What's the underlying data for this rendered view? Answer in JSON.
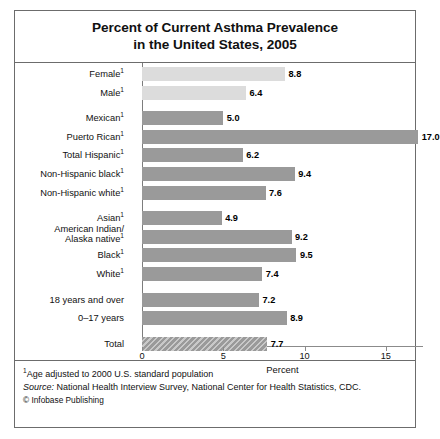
{
  "chart_data": {
    "type": "bar",
    "orientation": "horizontal",
    "title": "Percent of Current Asthma Prevalence in the United States, 2005",
    "title_line1": "Percent of Current Asthma Prevalence",
    "title_line2": "in the United States, 2005",
    "xlabel": "Percent",
    "ylabel": "",
    "xlim": [
      0,
      17.3
    ],
    "xticks": [
      0,
      5,
      10,
      15
    ],
    "xtick_labels": [
      "0",
      "5",
      "10",
      "15"
    ],
    "grid": false,
    "legend": false,
    "categories": [
      "Female¹",
      "Male¹",
      "Mexican¹",
      "Puerto Rican¹",
      "Total Hispanic¹",
      "Non-Hispanic black¹",
      "Non-Hispanic white¹",
      "Asian¹",
      "American Indian/ Alaska native¹",
      "Black¹",
      "White¹",
      "18 years and over",
      "0–17 years",
      "Total"
    ],
    "values": [
      8.8,
      6.4,
      5.0,
      17.0,
      6.2,
      9.4,
      7.6,
      4.9,
      9.2,
      9.5,
      7.4,
      7.2,
      8.9,
      7.7
    ],
    "value_labels": [
      "8.8",
      "6.4",
      "5.0",
      "17.0",
      "6.2",
      "9.4",
      "7.6",
      "4.9",
      "9.2",
      "9.5",
      "7.4",
      "7.2",
      "8.9",
      "7.7"
    ],
    "colors": {
      "bar_default": "#9a9a9a",
      "bar_light": "#dcdcdc",
      "bar_hatch": "#9a9a9a",
      "frame": "#6c6c6c",
      "axis": "#8b8b8b",
      "text": "#111111"
    }
  },
  "bars": [
    {
      "label_html": "Female<sup>1</sup>",
      "value_label": "8.8",
      "value": 8.8,
      "style": "light",
      "group": 0
    },
    {
      "label_html": "Male<sup>1</sup>",
      "value_label": "6.4",
      "value": 6.4,
      "style": "light",
      "group": 0
    },
    {
      "label_html": "Mexican<sup>1</sup>",
      "value_label": "5.0",
      "value": 5.0,
      "style": "solid",
      "group": 1
    },
    {
      "label_html": "Puerto Rican<sup>1</sup>",
      "value_label": "17.0",
      "value": 17.0,
      "style": "solid",
      "group": 1
    },
    {
      "label_html": "Total Hispanic<sup>1</sup>",
      "value_label": "6.2",
      "value": 6.2,
      "style": "solid",
      "group": 1
    },
    {
      "label_html": "Non-Hispanic black<sup>1</sup>",
      "value_label": "9.4",
      "value": 9.4,
      "style": "solid",
      "group": 1
    },
    {
      "label_html": "Non-Hispanic white<sup>1</sup>",
      "value_label": "7.6",
      "value": 7.6,
      "style": "solid",
      "group": 1
    },
    {
      "label_html": "Asian<sup>1</sup>",
      "value_label": "4.9",
      "value": 4.9,
      "style": "solid",
      "group": 2
    },
    {
      "label_html": "American Indian/<br>Alaska native<sup>1</sup>",
      "value_label": "9.2",
      "value": 9.2,
      "style": "solid",
      "group": 2,
      "two_line": true
    },
    {
      "label_html": "Black<sup>1</sup>",
      "value_label": "9.5",
      "value": 9.5,
      "style": "solid",
      "group": 2
    },
    {
      "label_html": "White<sup>1</sup>",
      "value_label": "7.4",
      "value": 7.4,
      "style": "solid",
      "group": 2
    },
    {
      "label_html": "18 years and over",
      "value_label": "7.2",
      "value": 7.2,
      "style": "solid",
      "group": 3
    },
    {
      "label_html": "0–17 years",
      "value_label": "8.9",
      "value": 8.9,
      "style": "solid",
      "group": 3
    },
    {
      "label_html": "Total",
      "value_label": "7.7",
      "value": 7.7,
      "style": "hatch",
      "group": 4
    }
  ],
  "axis": {
    "xlabel": "Percent",
    "ticks": [
      "0",
      "5",
      "10",
      "15"
    ],
    "tick_values": [
      0,
      5,
      10,
      15
    ]
  },
  "notes": {
    "footnote_marker": "1",
    "footnote_text": "Age adjusted to 2000 U.S. standard population",
    "source_label": "Source:",
    "source_text": "National Health Interview Survey, National Center for Health Statistics, CDC.",
    "copyright": "© Infobase Publishing"
  }
}
